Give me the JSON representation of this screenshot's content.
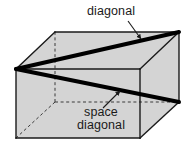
{
  "figure": {
    "background_color": "#ffffff",
    "face_fill_color": "#d4d4d4",
    "edge_color": "#1a1a1a",
    "diagonal_color": "#000000",
    "hidden_edge_style": "dashed"
  },
  "labels": {
    "diagonal": "diagonal",
    "space_diagonal_line1": "space",
    "space_diagonal_line2": "diagonal"
  },
  "shape": {
    "type": "rectangular-prism",
    "vertices": {
      "front_top_left": [
        16,
        69
      ],
      "front_top_right": [
        140,
        69
      ],
      "front_bottom_left": [
        16,
        138
      ],
      "front_bottom_right": [
        140,
        138
      ],
      "back_top_left": [
        55,
        32
      ],
      "back_top_right": [
        179,
        32
      ],
      "back_bottom_left": [
        55,
        102
      ],
      "back_bottom_right": [
        179,
        102
      ]
    },
    "face_diagonal": {
      "name": "diagonal",
      "from": "front_top_left",
      "to": "back_top_right"
    },
    "space_diagonal": {
      "name": "space diagonal",
      "from": "front_top_left",
      "to": "back_bottom_right"
    }
  },
  "annotations": {
    "diagonal_arrow": {
      "from": [
        128,
        21
      ],
      "to": [
        142,
        40
      ]
    },
    "space_diagonal_arrow": {
      "from": [
        103,
        108
      ],
      "to": [
        121,
        90
      ]
    }
  }
}
